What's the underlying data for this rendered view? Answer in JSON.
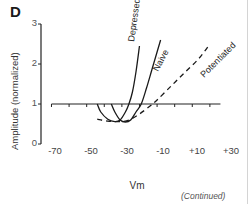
{
  "panel": {
    "letter": "D",
    "continued_note": "(Continued)"
  },
  "chart_data": {
    "type": "line",
    "title": "",
    "xlabel": "Vm",
    "ylabel": "Amplitude (normalized)",
    "xlim": [
      -75,
      35
    ],
    "ylim": [
      0,
      3
    ],
    "x_ticks": [
      "-70",
      "-50",
      "-30",
      "-10",
      "+10",
      "+30"
    ],
    "y_ticks": [
      "0",
      "1",
      "2",
      "3"
    ],
    "grid": false,
    "legend": "inline labels along curves",
    "reference_line": {
      "y": 1,
      "x_range": [
        -72,
        24
      ],
      "style": "solid with downward ticks every 10 mV"
    },
    "series": [
      {
        "name": "Depressed",
        "style": "solid",
        "points": [
          [
            -46,
            1.0
          ],
          [
            -44,
            0.8
          ],
          [
            -40,
            0.62
          ],
          [
            -36,
            0.56
          ],
          [
            -33,
            0.6
          ],
          [
            -30,
            0.8
          ],
          [
            -28,
            1.0
          ],
          [
            -26,
            1.3
          ],
          [
            -24,
            1.8
          ],
          [
            -22,
            2.45
          ]
        ]
      },
      {
        "name": "Naive",
        "style": "solid",
        "points": [
          [
            -38,
            1.0
          ],
          [
            -36,
            0.8
          ],
          [
            -33,
            0.6
          ],
          [
            -30,
            0.55
          ],
          [
            -27,
            0.6
          ],
          [
            -24,
            0.8
          ],
          [
            -21,
            1.0
          ],
          [
            -18,
            1.4
          ],
          [
            -15,
            1.85
          ],
          [
            -12,
            2.3
          ],
          [
            -10,
            2.6
          ]
        ]
      },
      {
        "name": "Potentiated",
        "style": "dashed",
        "points": [
          [
            -46,
            0.62
          ],
          [
            -40,
            0.57
          ],
          [
            -33,
            0.56
          ],
          [
            -28,
            0.6
          ],
          [
            -22,
            0.75
          ],
          [
            -16,
            0.95
          ],
          [
            -12,
            1.1
          ],
          [
            -4,
            1.45
          ],
          [
            4,
            1.8
          ],
          [
            12,
            2.15
          ],
          [
            18,
            2.5
          ]
        ]
      }
    ]
  }
}
